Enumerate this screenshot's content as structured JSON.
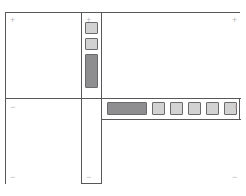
{
  "canvas": {
    "width": 246,
    "height": 196,
    "background": "#ffffff",
    "line_color": "#58585a"
  },
  "frame": {
    "label": "wireframe-frame",
    "border_color": "#58585a"
  },
  "markers": {
    "plus": "+",
    "minus": "−",
    "color": "#b9b9bb",
    "top_left": "+",
    "strip_top": "+",
    "top_right": "+",
    "middle_left": "−",
    "toolbar_right": "+",
    "bottom_left": "−",
    "strip_bottom": "−",
    "bottom_right": "−"
  },
  "panels": [
    {
      "name": "top-left-panel",
      "content": ""
    },
    {
      "name": "middle-left-panel",
      "content": ""
    },
    {
      "name": "bottom-left-panel",
      "content": ""
    },
    {
      "name": "top-right-panel",
      "content": ""
    },
    {
      "name": "bottom-right-panel",
      "content": ""
    }
  ],
  "vertical_strip": {
    "name": "vertical-tool-strip",
    "items": [
      {
        "name": "strip-swatch-1",
        "fill": "#d2d2d2",
        "shape": "square",
        "state": "inactive"
      },
      {
        "name": "strip-swatch-2",
        "fill": "#d2d2d2",
        "shape": "square",
        "state": "inactive"
      },
      {
        "name": "strip-slider",
        "fill": "#8e8e90",
        "shape": "tall-rect",
        "state": "active"
      }
    ]
  },
  "toolbar": {
    "name": "horizontal-toolbar",
    "items": [
      {
        "name": "toolbar-wide-bar",
        "fill": "#8e8e90",
        "shape": "wide-rect",
        "state": "active"
      },
      {
        "name": "toolbar-button-1",
        "fill": "#d2d2d2",
        "shape": "square",
        "state": "inactive"
      },
      {
        "name": "toolbar-button-2",
        "fill": "#d2d2d2",
        "shape": "square",
        "state": "inactive"
      },
      {
        "name": "toolbar-button-3",
        "fill": "#d2d2d2",
        "shape": "square",
        "state": "inactive"
      },
      {
        "name": "toolbar-button-4",
        "fill": "#d2d2d2",
        "shape": "square",
        "state": "inactive"
      },
      {
        "name": "toolbar-button-5",
        "fill": "#d2d2d2",
        "shape": "square",
        "state": "inactive"
      }
    ]
  }
}
